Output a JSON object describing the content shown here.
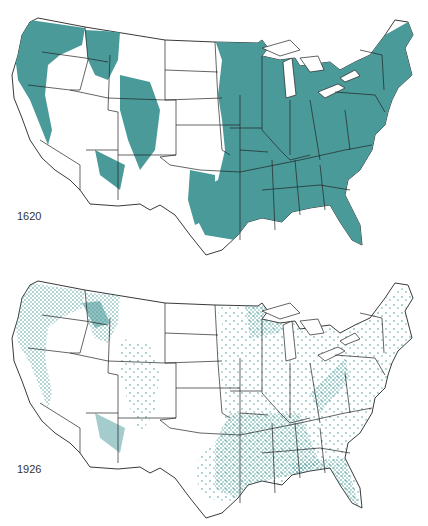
{
  "colors": {
    "forest": "#4a9a9a",
    "boundary": "#222222",
    "background": "#ffffff"
  },
  "maps": [
    {
      "year_label": "1620",
      "description": "Forest cover in 1620: nearly all of the eastern half covered, plus Pacific Northwest, Rockies and Sierra Nevada"
    },
    {
      "year_label": "1926",
      "description": "Virgin forest remaining in 1926: scattered dots, concentrations in the Pacific Northwest, Rockies, Gulf Coast, Florida, Appalachians and Great Lakes"
    }
  ]
}
